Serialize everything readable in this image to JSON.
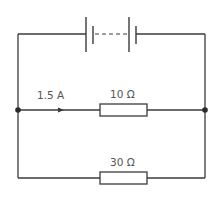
{
  "diagram": {
    "type": "circuit",
    "battery": {
      "label": "",
      "cells": 2,
      "connection": "dashed (multiple cells)"
    },
    "branches": [
      {
        "name": "upper-branch",
        "resistor_label": "10 Ω",
        "current_label": "1.5 A"
      },
      {
        "name": "lower-branch",
        "resistor_label": "30 Ω"
      }
    ],
    "colors": {
      "wire": "#3a3a3a",
      "text": "#555555",
      "background": "#ffffff"
    }
  }
}
